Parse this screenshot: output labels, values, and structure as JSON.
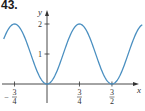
{
  "problem_label": "43.",
  "chart_data": {
    "type": "line",
    "title": "",
    "xlabel": "x",
    "ylabel": "y",
    "function": "y = 1 - cos(4πx/3)",
    "series": [
      {
        "name": "curve",
        "x": [
          -1.0,
          -0.75,
          -0.375,
          0,
          0.375,
          0.75,
          1.125,
          1.5,
          1.875,
          2.2
        ],
        "values": [
          1.5,
          2,
          1,
          0,
          1,
          2,
          1,
          0,
          1,
          1.95
        ]
      }
    ],
    "x_ticks": [
      {
        "value": -0.75,
        "label_num": "3",
        "label_den": "4",
        "sign": "−"
      },
      {
        "value": 0.75,
        "label_num": "3",
        "label_den": "4",
        "sign": ""
      },
      {
        "value": 1.5,
        "label_num": "3",
        "label_den": "2",
        "sign": ""
      }
    ],
    "y_ticks": [
      {
        "value": 1,
        "label": "1"
      },
      {
        "value": 2,
        "label": "2"
      }
    ],
    "xlim": [
      -1.05,
      2.25
    ],
    "ylim": [
      -0.4,
      2.5
    ],
    "grid": false,
    "line_color": "#4a8fc0",
    "axis_color": "#333333"
  }
}
